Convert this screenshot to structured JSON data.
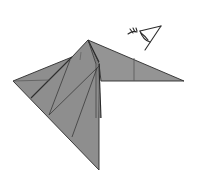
{
  "diagram": {
    "type": "origami-step",
    "colors": {
      "background": "#ffffff",
      "paper_fill": "#8f8f8f",
      "paper_fill_light": "#999999",
      "crease_line": "#3a3a3a",
      "outline": "#2b2b2b",
      "symbol": "#2b2b2b"
    },
    "symbols": [
      {
        "name": "view-from-eye-symbol",
        "meaning": "view from this direction"
      }
    ]
  }
}
